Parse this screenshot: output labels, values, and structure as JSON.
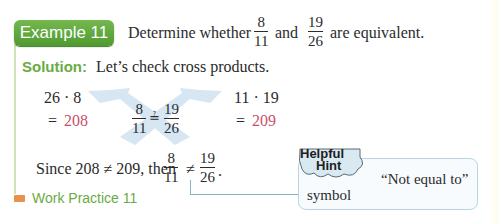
{
  "example": {
    "badge_label": "Example 11",
    "prompt_prefix": "Determine whether",
    "fraction_a": {
      "numerator": "8",
      "denominator": "11"
    },
    "connector": "and",
    "fraction_b": {
      "numerator": "19",
      "denominator": "26"
    },
    "prompt_suffix": "are equivalent."
  },
  "solution": {
    "label": "Solution:",
    "intro": "Let’s check cross products.",
    "left_product": "26 · 8",
    "left_equals": "=",
    "left_result": "208",
    "right_product": "11 · 19",
    "right_equals": "=",
    "right_result": "209",
    "center_fraction_a": {
      "numerator": "8",
      "denominator": "11"
    },
    "center_relation": "≟",
    "center_fraction_b": {
      "numerator": "19",
      "denominator": "26"
    },
    "conclusion_prefix": "Since 208 ≠ 209, then",
    "conclusion_fraction_a": {
      "numerator": "8",
      "denominator": "11"
    },
    "conclusion_relation": "≠",
    "conclusion_fraction_b": {
      "numerator": "19",
      "denominator": "26"
    },
    "conclusion_suffix": "."
  },
  "work_practice": {
    "label": "Work Practice 11"
  },
  "helpful_hint": {
    "title_line1": "Helpful",
    "title_line2": "Hint",
    "text_line1": "“Not equal to”",
    "text_line2": "symbol"
  },
  "colors": {
    "accent_green": "#5fa63a",
    "result_pink": "#c9506b",
    "arrow_blue": "#cfe2f0",
    "hint_border": "#b8d6e2",
    "marker_orange": "#e8914a"
  }
}
